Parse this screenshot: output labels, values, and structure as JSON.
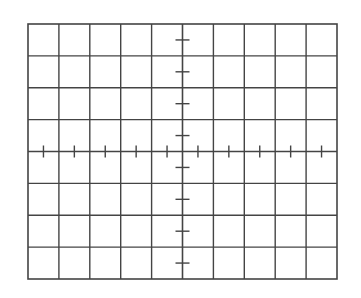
{
  "graticule": {
    "columns": 10,
    "rows": 8,
    "x0": 28,
    "y0": 24,
    "x1": 337,
    "y1": 279,
    "minor_ticks_per_division": 2,
    "tick_length": 10,
    "line_color": "#444444",
    "background_color": "#ffffff"
  }
}
